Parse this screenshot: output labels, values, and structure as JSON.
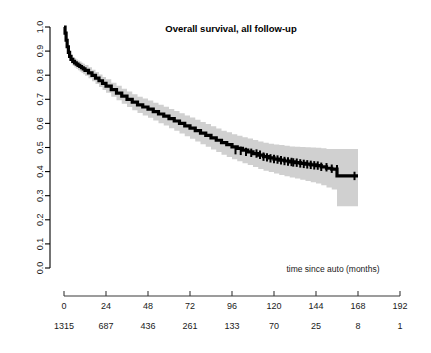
{
  "figure": {
    "title": "Overall survival, all follow-up",
    "background": "#ffffff"
  },
  "chart_data": {
    "type": "line",
    "title": "Overall survival, all follow-up",
    "xlabel": "time since auto (months)",
    "ylabel": "",
    "xlim": [
      0,
      192
    ],
    "ylim": [
      0,
      1
    ],
    "xticks": [
      0,
      24,
      48,
      72,
      96,
      120,
      144,
      168,
      192
    ],
    "xticklabels": [
      "0",
      "24",
      "48",
      "72",
      "96",
      "120",
      "144",
      "168",
      "192"
    ],
    "yticks": [
      0.0,
      0.1,
      0.2,
      0.3,
      0.4,
      0.5,
      0.6,
      0.7,
      0.8,
      0.9,
      1.0
    ],
    "yticklabels": [
      "0.0",
      "0.1",
      "0.2",
      "0.3",
      "0.4",
      "0.5",
      "0.6",
      "0.7",
      "0.8",
      "0.9",
      "1.0"
    ],
    "grid": false,
    "legend": null,
    "curve_color": "#000000",
    "ci_color": "#d0d0d0",
    "series": [
      {
        "name": "Overall survival",
        "style": "kaplan-meier-step",
        "x": [
          0,
          0.6,
          1.2,
          1.8,
          2.5,
          3.2,
          4,
          5,
          6,
          7,
          8,
          9,
          10,
          11,
          12,
          14,
          16,
          18,
          20,
          22,
          24,
          27,
          30,
          33,
          36,
          39,
          42,
          45,
          48,
          51,
          54,
          57,
          60,
          63,
          66,
          69,
          72,
          75,
          78,
          81,
          84,
          87,
          90,
          93,
          96,
          99,
          102,
          105,
          108,
          111,
          114,
          117,
          120,
          123,
          126,
          129,
          132,
          135,
          138,
          141,
          144,
          147,
          150,
          153,
          156,
          159,
          162,
          165,
          168
        ],
        "y": [
          1.0,
          0.975,
          0.945,
          0.918,
          0.895,
          0.878,
          0.866,
          0.857,
          0.851,
          0.846,
          0.841,
          0.836,
          0.831,
          0.826,
          0.82,
          0.81,
          0.799,
          0.788,
          0.777,
          0.766,
          0.755,
          0.74,
          0.726,
          0.713,
          0.7,
          0.688,
          0.677,
          0.668,
          0.659,
          0.649,
          0.639,
          0.63,
          0.62,
          0.61,
          0.6,
          0.59,
          0.58,
          0.57,
          0.56,
          0.55,
          0.54,
          0.53,
          0.52,
          0.512,
          0.503,
          0.496,
          0.489,
          0.482,
          0.475,
          0.468,
          0.462,
          0.457,
          0.452,
          0.448,
          0.444,
          0.44,
          0.437,
          0.434,
          0.431,
          0.428,
          0.425,
          0.42,
          0.414,
          0.41,
          0.382,
          0.382,
          0.382,
          0.382,
          0.382
        ],
        "ci_lower": [
          1.0,
          0.968,
          0.934,
          0.905,
          0.881,
          0.862,
          0.849,
          0.839,
          0.832,
          0.827,
          0.821,
          0.815,
          0.81,
          0.804,
          0.798,
          0.787,
          0.775,
          0.763,
          0.751,
          0.739,
          0.727,
          0.711,
          0.696,
          0.682,
          0.668,
          0.655,
          0.643,
          0.633,
          0.623,
          0.612,
          0.601,
          0.591,
          0.58,
          0.569,
          0.558,
          0.547,
          0.536,
          0.525,
          0.514,
          0.503,
          0.492,
          0.481,
          0.47,
          0.461,
          0.451,
          0.443,
          0.435,
          0.427,
          0.419,
          0.411,
          0.404,
          0.398,
          0.392,
          0.386,
          0.381,
          0.376,
          0.371,
          0.366,
          0.361,
          0.356,
          0.351,
          0.343,
          0.334,
          0.326,
          0.256,
          0.256,
          0.256,
          0.256,
          0.256
        ],
        "ci_upper": [
          1.0,
          0.982,
          0.956,
          0.931,
          0.909,
          0.894,
          0.883,
          0.875,
          0.87,
          0.865,
          0.861,
          0.857,
          0.852,
          0.848,
          0.842,
          0.833,
          0.823,
          0.813,
          0.803,
          0.793,
          0.783,
          0.769,
          0.756,
          0.744,
          0.732,
          0.721,
          0.711,
          0.703,
          0.695,
          0.686,
          0.677,
          0.669,
          0.66,
          0.651,
          0.642,
          0.633,
          0.624,
          0.615,
          0.606,
          0.597,
          0.588,
          0.579,
          0.57,
          0.563,
          0.555,
          0.549,
          0.543,
          0.537,
          0.531,
          0.525,
          0.52,
          0.516,
          0.512,
          0.51,
          0.507,
          0.504,
          0.503,
          0.502,
          0.501,
          0.5,
          0.499,
          0.497,
          0.494,
          0.494,
          0.494,
          0.494,
          0.494,
          0.494,
          0.494
        ],
        "censor_x": [
          98,
          101,
          104,
          107,
          110,
          112,
          114,
          116,
          118,
          120,
          122,
          124,
          126,
          128,
          130,
          131,
          133,
          135,
          137,
          139,
          141,
          143,
          145,
          147,
          150,
          153,
          156,
          166
        ],
        "censor_y": [
          0.489,
          0.486,
          0.482,
          0.478,
          0.475,
          0.47,
          0.462,
          0.459,
          0.455,
          0.452,
          0.45,
          0.447,
          0.444,
          0.442,
          0.44,
          0.438,
          0.437,
          0.434,
          0.432,
          0.43,
          0.428,
          0.426,
          0.425,
          0.42,
          0.418,
          0.412,
          0.41,
          0.382
        ]
      }
    ]
  },
  "risk_table": {
    "label": "",
    "times": [
      0,
      24,
      48,
      72,
      96,
      120,
      144,
      168,
      192
    ],
    "counts": [
      "1315",
      "687",
      "436",
      "261",
      "133",
      "70",
      "25",
      "8",
      "1"
    ]
  }
}
